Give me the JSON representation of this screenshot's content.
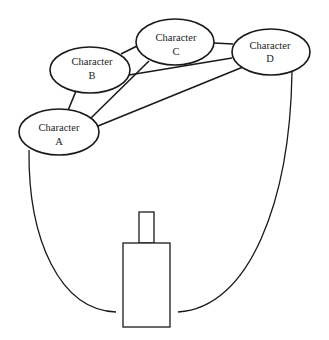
{
  "diagram": {
    "nodes": [
      {
        "id": "A",
        "line1": "Character",
        "line2": "A",
        "cx": 59,
        "cy": 132,
        "rx": 40,
        "ry": 23
      },
      {
        "id": "B",
        "line1": "Character",
        "line2": "B",
        "cx": 90,
        "cy": 70,
        "rx": 40,
        "ry": 23
      },
      {
        "id": "C",
        "line1": "Character",
        "line2": "C",
        "cx": 175,
        "cy": 42,
        "rx": 39,
        "ry": 23
      },
      {
        "id": "D",
        "line1": "Character",
        "line2": "D",
        "cx": 271,
        "cy": 52,
        "rx": 39,
        "ry": 23
      }
    ],
    "edges": [
      {
        "from": "A",
        "to": "B"
      },
      {
        "from": "A",
        "to": "C"
      },
      {
        "from": "A",
        "to": "D"
      },
      {
        "from": "B",
        "to": "C"
      },
      {
        "from": "B",
        "to": "D"
      },
      {
        "from": "C",
        "to": "D"
      }
    ],
    "object": {
      "shape": "rectangle with small rectangle on top"
    },
    "colors": {
      "stroke": "#1a1a1a",
      "background": "#ffffff"
    }
  }
}
